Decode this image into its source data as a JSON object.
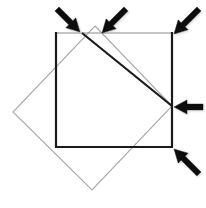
{
  "canvas": {
    "width": 206,
    "height": 208,
    "background": "#ffffff",
    "description": "Geometry figure: an axis-aligned square overlapped by a rotated square, with four arrows indicating vertices"
  },
  "colors": {
    "outline_black": "#1a1a1a",
    "outline_gray": "#8c8c8c",
    "outline_light_gray": "#a9a9a9",
    "arrow_fill": "#111111",
    "background": "#ffffff"
  },
  "shapes": {
    "gray_square": {
      "label": "gray axis aligned square",
      "stroke": "#8c8c8c",
      "stroke_width": 1.2,
      "points": "56,33 172,33 172,147 56,147"
    },
    "black_square_outline": {
      "label": "black square outline",
      "stroke": "#1a1a1a",
      "stroke_width": 2.0,
      "points": "56,33 172,33 172,147 56,147"
    },
    "black_square_visible_path": {
      "label": "heavy black path: left edge, bottom edge, right edge lower part",
      "stroke": "#1a1a1a",
      "stroke_width": 2.2,
      "path": "M 56,33 L 56,147 L 172,147 L 172,33"
    },
    "rotated_square": {
      "label": "light gray rotated square diamond",
      "stroke": "#a9a9a9",
      "stroke_width": 1.1,
      "points": "95,26 172,106 92,190 13,112"
    },
    "rotated_square_highlight": {
      "label": "thick black chord from top vertex to right vertex",
      "stroke": "#1a1a1a",
      "stroke_width": 2.2,
      "path": "M 82,33 L 172,106"
    }
  },
  "arrows": [
    {
      "id": "arrow-top-left",
      "name": "arrow-top-left",
      "target_label": "top vertex of black square",
      "tip_x": 80,
      "tip_y": 32,
      "tail_x": 57,
      "tail_y": 9,
      "angle_deg": 45,
      "length": 33
    },
    {
      "id": "arrow-top-right",
      "name": "arrow-top-right",
      "target_label": "top vertex of rotated square",
      "tip_x": 102,
      "tip_y": 33,
      "tail_x": 126,
      "tail_y": 9,
      "angle_deg": 135,
      "length": 34
    },
    {
      "id": "arrow-corner-top-right",
      "name": "arrow-corner-top-right",
      "target_label": "top right corner of gray square",
      "tip_x": 174,
      "tip_y": 34,
      "tail_x": 199,
      "tail_y": 9,
      "angle_deg": 135,
      "length": 35
    },
    {
      "id": "arrow-right-middle",
      "name": "arrow-right-middle",
      "target_label": "right vertex of rotated square",
      "tip_x": 174,
      "tip_y": 107,
      "tail_x": 203,
      "tail_y": 107,
      "angle_deg": 180,
      "length": 29
    },
    {
      "id": "arrow-bottom-right",
      "name": "arrow-bottom-right",
      "target_label": "bottom right corner of black square",
      "tip_x": 174,
      "tip_y": 149,
      "tail_x": 199,
      "tail_y": 174,
      "angle_deg": 225,
      "length": 35
    }
  ]
}
